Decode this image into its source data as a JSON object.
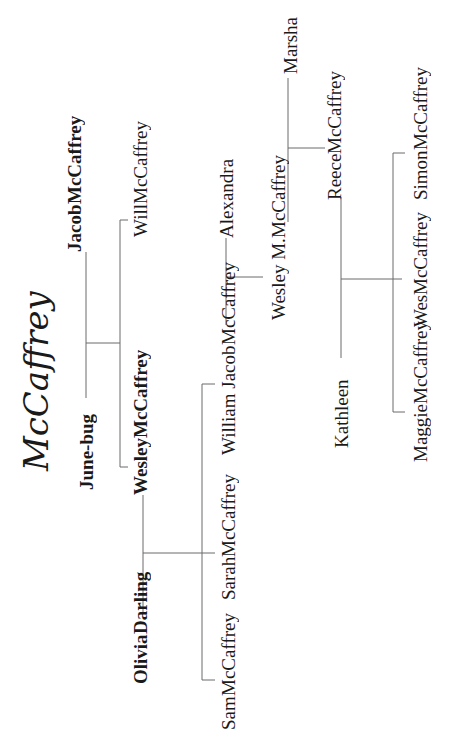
{
  "title": "McCaffrey",
  "people": {
    "jacob": {
      "line1": "Jacob",
      "line2": "McCaffrey"
    },
    "june_bug": {
      "line1": "June-bug"
    },
    "will": {
      "line1": "Will",
      "line2": "McCaffrey"
    },
    "wesley": {
      "line1": "Wesley",
      "line2": "McCaffrey"
    },
    "olivia": {
      "line1": "Olivia",
      "line2": "Darling"
    },
    "william_jacob": {
      "line1": "William Jacob",
      "line2": "McCaffrey"
    },
    "sarah": {
      "line1": "Sarah",
      "line2": "McCaffrey"
    },
    "sam": {
      "line1": "Sam",
      "line2": "McCaffrey"
    },
    "alexandra": {
      "line1": "Alexandra"
    },
    "wesley_m": {
      "line1": "Wesley M.",
      "line2": "McCaffrey"
    },
    "marsha": {
      "line1": "Marsha"
    },
    "reece": {
      "line1": "Reece",
      "line2": "McCaffrey"
    },
    "kathleen": {
      "line1": "Kathleen"
    },
    "simon": {
      "line1": "Simon",
      "line2": "McCaffrey"
    },
    "wes": {
      "line1": "Wes",
      "line2": "McCaffrey"
    },
    "maggie": {
      "line1": "Maggie",
      "line2": "McCaffrey"
    }
  },
  "relationships": [
    {
      "type": "couple",
      "a": "Jacob McCaffrey",
      "b": "June-bug",
      "children": [
        "Will McCaffrey",
        "Wesley McCaffrey"
      ]
    },
    {
      "type": "couple",
      "a": "Wesley McCaffrey",
      "b": "Olivia Darling",
      "children": [
        "William Jacob McCaffrey",
        "Sarah McCaffrey",
        "Sam McCaffrey"
      ]
    },
    {
      "type": "couple",
      "a": "Alexandra",
      "b": "William Jacob McCaffrey",
      "children": [
        "Wesley M. McCaffrey"
      ]
    },
    {
      "type": "couple",
      "a": "Marsha",
      "b": "Wesley M. McCaffrey",
      "children": [
        "Reece McCaffrey"
      ]
    },
    {
      "type": "couple",
      "a": "Reece McCaffrey",
      "b": "Kathleen",
      "children": [
        "Simon McCaffrey",
        "Wes McCaffrey",
        "Maggie McCaffrey"
      ]
    }
  ],
  "colors": {
    "text": "#1a1a1a",
    "line": "#6a6a6a",
    "background": "#ffffff"
  }
}
